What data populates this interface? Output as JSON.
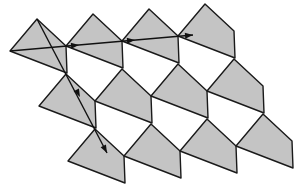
{
  "diagram": {
    "type": "periodic-tiling",
    "colors": {
      "tile_fill": "#c4c4c4",
      "stroke": "#1a1a1a",
      "background": "#ffffff"
    },
    "tile_shape": [
      [
        10,
        51
      ],
      [
        37,
        19
      ],
      [
        66,
        46
      ],
      [
        67,
        73
      ]
    ],
    "lattice": {
      "a": [
        56,
        -5
      ],
      "b": [
        29,
        55
      ]
    },
    "rows": [
      {
        "j": 0,
        "count": 4
      },
      {
        "j": 1,
        "count": 4
      },
      {
        "j": 2,
        "count": 4
      }
    ],
    "arrows": [
      {
        "name": "horizontal-translation",
        "from": [
          10,
          51
        ],
        "to": [
          193,
          35
        ],
        "heads": [
          [
            79,
            45
          ],
          [
            135,
            40
          ],
          [
            193,
            35
          ]
        ]
      },
      {
        "name": "diagonal-translation",
        "from": [
          37,
          19
        ],
        "to": [
          107,
          153
        ],
        "heads": [
          [
            80,
            97
          ],
          [
            107,
            153
          ]
        ]
      }
    ]
  }
}
